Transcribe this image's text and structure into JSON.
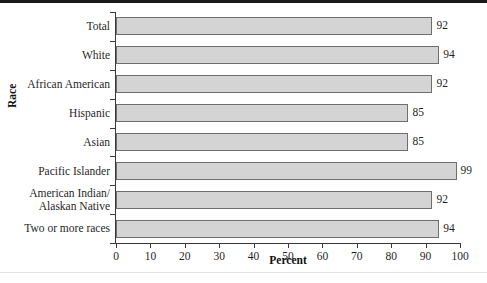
{
  "chart_data": {
    "type": "bar",
    "orientation": "horizontal",
    "title": "",
    "xlabel": "Percent",
    "ylabel": "Race",
    "xlim": [
      0,
      100
    ],
    "xticks": [
      0,
      10,
      20,
      30,
      40,
      50,
      60,
      70,
      80,
      90,
      100
    ],
    "grid": false,
    "legend": null,
    "categories": [
      "Total",
      "White",
      "African American",
      "Hispanic",
      "Asian",
      "Pacific Islander",
      "American Indian/ Alaskan Native",
      "Two or more races"
    ],
    "values": [
      92,
      94,
      92,
      85,
      85,
      99,
      92,
      94
    ],
    "value_labels": [
      "92",
      "94",
      "92",
      "85",
      "85",
      "99",
      "92",
      "94"
    ],
    "colors": {
      "bar_fill": "#d4d4d4",
      "bar_edge": "#6e6e6e",
      "axis": "#3a3a3a",
      "text": "#1f1f1f",
      "background": "#ffffff",
      "top_rule": "#1b1b1b"
    }
  },
  "category_label_lines": [
    [
      "Total"
    ],
    [
      "White"
    ],
    [
      "African American"
    ],
    [
      "Hispanic"
    ],
    [
      "Asian"
    ],
    [
      "Pacific Islander"
    ],
    [
      "American Indian/",
      "Alaskan Native"
    ],
    [
      "Two or more races"
    ]
  ]
}
